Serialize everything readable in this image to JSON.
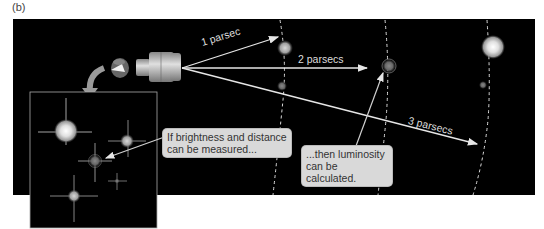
{
  "figure": {
    "panel_label": "(b)",
    "distance_labels": [
      {
        "text": "1 parsec"
      },
      {
        "text": "2 parsecs"
      },
      {
        "text": "3 parsecs"
      }
    ],
    "callouts": [
      {
        "line1": "If brightness and distance",
        "line2": "can be measured..."
      },
      {
        "line1": "...then luminosity",
        "line2": "can be calculated."
      }
    ],
    "icons": [
      "eye-icon",
      "telescope-icon",
      "curved-arrow-icon",
      "star-field-inset"
    ],
    "colors": {
      "background": "#000000",
      "arrow": "#e6e6e6",
      "callout_fill": "#d9d9d9",
      "star_glow": "#f2f2f2"
    }
  }
}
